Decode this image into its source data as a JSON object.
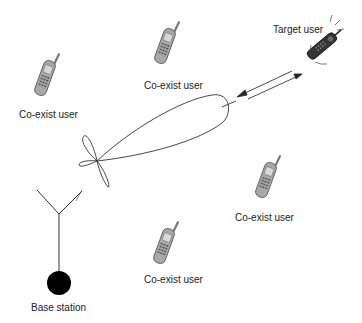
{
  "diagram": {
    "labels": {
      "coexist_1": "Co-exist user",
      "coexist_2": "Co-exist user",
      "coexist_3": "Co-exist user",
      "coexist_4": "Co-exist user",
      "target": "Target user",
      "base_station": "Base station"
    },
    "icons": {
      "phone": "mobile-phone-icon",
      "antenna": "antenna-icon",
      "beam": "beam-pattern",
      "link": "bidirectional-arrow"
    },
    "colors": {
      "line": "#333333",
      "phone_body": "#9a9a9a",
      "phone_dark": "#555555",
      "base": "#000000"
    }
  }
}
